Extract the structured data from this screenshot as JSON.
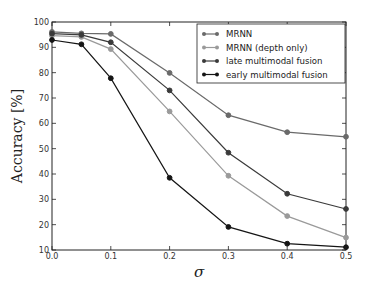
{
  "chart_data": {
    "type": "line",
    "title": "",
    "xlabel": "σ",
    "ylabel": "Accuracy [%]",
    "xlim": [
      0.0,
      0.5
    ],
    "ylim": [
      10,
      100
    ],
    "x": [
      0.0,
      0.05,
      0.1,
      0.2,
      0.3,
      0.4,
      0.5
    ],
    "xticks": [
      "0.0",
      "0.1",
      "0.2",
      "0.3",
      "0.4",
      "0.5"
    ],
    "yticks": [
      "10",
      "20",
      "30",
      "40",
      "50",
      "60",
      "70",
      "80",
      "90",
      "100"
    ],
    "grid": false,
    "legend_position": "upper right",
    "series": [
      {
        "name": "MRNN",
        "color": "#6a6a6a",
        "values": [
          96.1,
          95.5,
          95.3,
          79.9,
          63.2,
          56.5,
          54.7
        ]
      },
      {
        "name": "MRNN (depth only)",
        "color": "#9a9a9a",
        "values": [
          94.6,
          94.1,
          89.3,
          64.7,
          39.3,
          23.4,
          14.9
        ]
      },
      {
        "name": "late multimodal fusion",
        "color": "#3a3a3a",
        "values": [
          95.4,
          94.9,
          92.0,
          73.0,
          48.4,
          32.2,
          26.2
        ]
      },
      {
        "name": "early multimodal fusion",
        "color": "#151515",
        "values": [
          92.9,
          91.2,
          77.8,
          38.5,
          19.1,
          12.5,
          11.1
        ]
      }
    ]
  }
}
